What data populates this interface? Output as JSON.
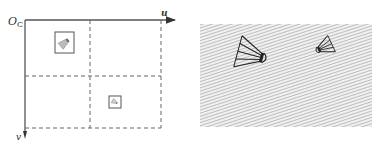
{
  "left_panel": {
    "origin_label": "O",
    "origin_subscript": "C",
    "u_axis_label": "u",
    "v_axis_label": "v",
    "quadrants": 4,
    "thumbnails": [
      {
        "quadrant": "top-left",
        "content": "shuttlecock"
      },
      {
        "quadrant": "bottom-right",
        "content": "shuttlecock"
      }
    ]
  },
  "right_panel": {
    "background": "hatched",
    "objects": [
      {
        "name": "shuttlecock-large",
        "content": "shuttlecock"
      },
      {
        "name": "shuttlecock-small",
        "content": "shuttlecock"
      }
    ]
  },
  "colors": {
    "axis": "#555555",
    "dash": "#666666",
    "hatch": "#c8c8c8",
    "ink": "#222222"
  }
}
